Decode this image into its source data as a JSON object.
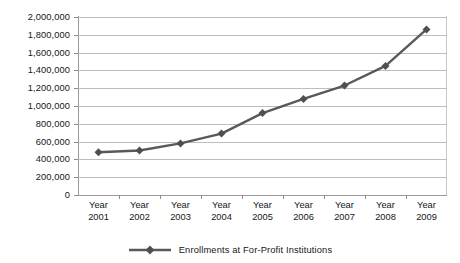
{
  "chart_data": {
    "type": "line",
    "title": "",
    "xlabel": "",
    "ylabel": "",
    "categories": [
      "Year 2001",
      "Year 2002",
      "Year 2003",
      "Year 2004",
      "Year 2005",
      "Year 2006",
      "Year 2007",
      "Year 2008",
      "Year 2009"
    ],
    "category_lines": [
      [
        "Year",
        "2001"
      ],
      [
        "Year",
        "2002"
      ],
      [
        "Year",
        "2003"
      ],
      [
        "Year",
        "2004"
      ],
      [
        "Year",
        "2005"
      ],
      [
        "Year",
        "2006"
      ],
      [
        "Year",
        "2007"
      ],
      [
        "Year",
        "2008"
      ],
      [
        "Year",
        "2009"
      ]
    ],
    "series": [
      {
        "name": "Enrollments at For-Profit Institutions",
        "color": "#595959",
        "marker": "diamond",
        "values": [
          480000,
          500000,
          580000,
          690000,
          920000,
          1080000,
          1230000,
          1450000,
          1860000
        ]
      }
    ],
    "ylim": [
      0,
      2000000
    ],
    "yticks": [
      0,
      200000,
      400000,
      600000,
      800000,
      1000000,
      1200000,
      1400000,
      1600000,
      1800000,
      2000000
    ],
    "ytick_labels": [
      "0",
      "200,000",
      "400,000",
      "600,000",
      "800,000",
      "1,000,000",
      "1,200,000",
      "1,400,000",
      "1,600,000",
      "1,800,000",
      "2,000,000"
    ],
    "grid": true,
    "legend_position": "bottom",
    "legend_entries": [
      "Enrollments at For-Profit Institutions"
    ],
    "colors": {
      "series": "#595959",
      "gridline": "#bdbdbd",
      "axis": "#9a9a9a",
      "text": "#161616",
      "background": "#ffffff"
    }
  }
}
